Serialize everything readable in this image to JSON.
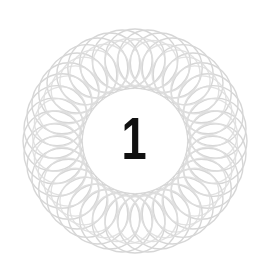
{
  "page": {
    "background_color": "#ffffff",
    "width": 268,
    "height": 278
  },
  "ornament": {
    "name": "spirograph-rosette",
    "kind": "guilloche",
    "line_color": "#d6d6d6",
    "line_color_secondary": "#dedede",
    "stroke_width": 1.4,
    "center_x": 135,
    "center_y": 141,
    "outer_radius": 112,
    "inner_clear_radius": 52,
    "petal_count": 20,
    "ring_count": 2
  },
  "chapter": {
    "number": "1",
    "number_color": "#111111"
  }
}
